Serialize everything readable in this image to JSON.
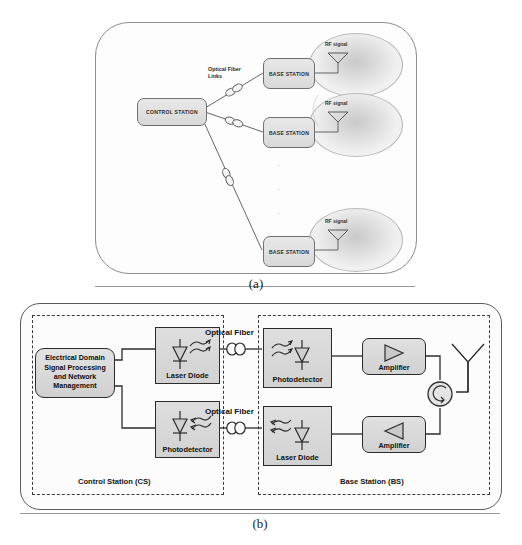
{
  "figure": {
    "panel_a": {
      "caption": "(a)",
      "control_station_label": "CONTROL STATION",
      "optical_fiber_links_label_line1": "Optical Fiber",
      "optical_fiber_links_label_line2": "Links",
      "base_stations": [
        {
          "label": "BASE STATION",
          "rf_label": "RF signal"
        },
        {
          "label": "BASE STATION",
          "rf_label": "RF signal"
        },
        {
          "label": "BASE STATION",
          "rf_label": "RF signal"
        }
      ],
      "continuation_dots": "·"
    },
    "panel_b": {
      "caption": "(b)",
      "zones": [
        {
          "label": "Control Station (CS)"
        },
        {
          "label": "Base Station (BS)"
        }
      ],
      "cs_processing_block": "Electrical Domain Signal Processing and Network Management",
      "cs_processing_lines": [
        "Electrical Domain",
        "Signal Processing",
        "and Network",
        "Management"
      ],
      "blocks": {
        "cs_laser_diode": "Laser Diode",
        "cs_photodetector": "Photodetector",
        "bs_photodetector": "Photodetector",
        "bs_laser_diode": "Laser Diode",
        "amplifier_downlink": "Amplifier",
        "amplifier_uplink": "Amplifier"
      },
      "optical_fiber_label_top": "Optical Fiber",
      "optical_fiber_label_bottom": "Optical Fiber"
    }
  },
  "colors": {
    "frame_stroke": "#5a5a5a",
    "block_stroke": "#2b2b2b",
    "block_fill": "#d8d8d8",
    "cell_fill": "#dcdcdc",
    "wire": "#2b2b2b"
  }
}
